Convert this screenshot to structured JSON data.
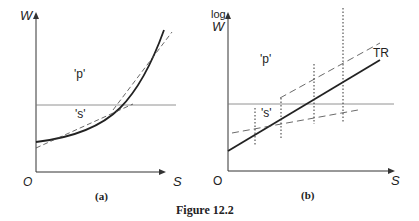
{
  "figure": {
    "caption": "Figure 12.2",
    "panels": [
      {
        "id": "a",
        "label": "(a)",
        "y_axis_label": "W",
        "x_axis_label": "S",
        "origin_label": "O",
        "region_labels": [
          "'p'",
          "'s'"
        ]
      },
      {
        "id": "b",
        "label": "(b)",
        "y_axis_label_line1": "log",
        "y_axis_label_line2": "W",
        "x_axis_label": "S",
        "origin_label": "O",
        "region_labels": [
          "'p'",
          "'s'"
        ],
        "line_label": "TR"
      }
    ]
  },
  "colors": {
    "ink": "#222222",
    "thin": "#555555"
  }
}
